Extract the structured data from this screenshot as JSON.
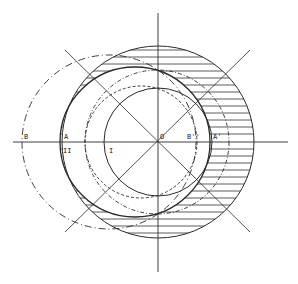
{
  "diagram": {
    "labels": {
      "B": "B",
      "A": "A",
      "O": "O",
      "B2": "B''",
      "A1": "A'",
      "I": "I",
      "II": "II"
    },
    "colors": {
      "ink": "#2a2a2a",
      "background": "#ffffff"
    }
  }
}
